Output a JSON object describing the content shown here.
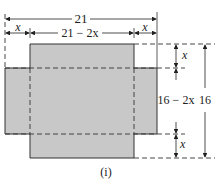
{
  "diagram": {
    "labels": {
      "width_total": "21",
      "x_left": "x",
      "width_inner": "21 − 2x",
      "x_right": "x",
      "x_top": "x",
      "height_inner": "16 − 2x",
      "height_total": "16",
      "x_bottom": "x",
      "caption": "(i)"
    },
    "colors": {
      "fill": "#c8c8c8",
      "line": "#333333"
    }
  }
}
